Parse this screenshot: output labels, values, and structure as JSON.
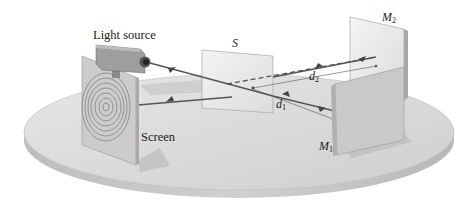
{
  "diagram": {
    "type": "michelson-interferometer",
    "labels": {
      "light_source": "Light source",
      "splitter": "S",
      "screen": "Screen",
      "mirror1_main": "M",
      "mirror1_sub": "1",
      "mirror2_main": "M",
      "mirror2_sub": "2",
      "d1_main": "d",
      "d1_sub": "1",
      "d2_main": "d",
      "d2_sub": "2"
    },
    "components": [
      {
        "id": "light-source",
        "label": "Light source"
      },
      {
        "id": "beam-splitter",
        "label": "S"
      },
      {
        "id": "screen",
        "label": "Screen",
        "pattern": "concentric interference fringes"
      },
      {
        "id": "mirror-1",
        "label": "M1"
      },
      {
        "id": "mirror-2",
        "label": "M2"
      }
    ],
    "distances": [
      "d1",
      "d2"
    ],
    "colors": {
      "platform_top": "#d9d9d9",
      "platform_side": "#c4c4c4",
      "panel": "#cfcfcf",
      "beam": "#555555"
    }
  }
}
